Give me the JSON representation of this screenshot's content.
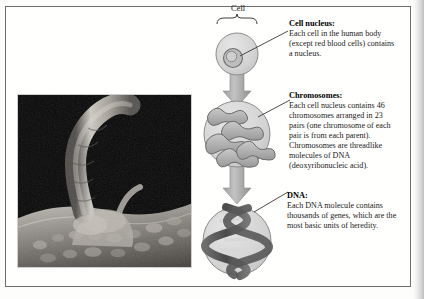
{
  "figure": {
    "credit": "Bonnier Alba",
    "top_label": "Cell"
  },
  "photo": {
    "alt_name": "electron-micrograph-of-cell-surface"
  },
  "callouts": [
    {
      "id": "nucleus",
      "title": "Cell nucleus:",
      "body": "Each cell in the human body (except red blood cells) contains a nucleus."
    },
    {
      "id": "chromosomes",
      "title": "Chromosomes:",
      "body": "Each cell nucleus contains 46 chromosomes arranged in 23 pairs (one chromosome of each pair is from each parent). Chromosomes are threadlike molecules of DNA (deoxyribonucleic acid)."
    },
    {
      "id": "dna",
      "title": "DNA:",
      "body": "Each DNA molecule contains thousands of genes, which are the most basic units of heredity."
    }
  ],
  "colors": {
    "diagram_fill": "#b9b9b9",
    "diagram_stroke": "#6b6b6b",
    "circle_fill": "#d5d5d5",
    "arrow_fill": "#b0b0b0",
    "border": "#6e6e6e",
    "text": "#1a1a1a"
  }
}
